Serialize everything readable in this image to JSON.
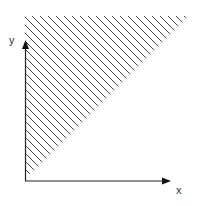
{
  "diagram": {
    "x_label": "x",
    "y_label": "y",
    "region": "shaded triangle above diagonal line from top-right to bottom-left",
    "colors": {
      "axis": "#222222",
      "hatch": "#333333",
      "background": "#ffffff"
    }
  }
}
